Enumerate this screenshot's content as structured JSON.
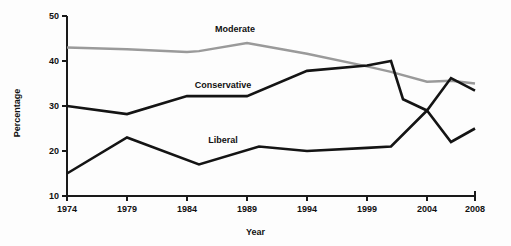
{
  "chart_data": {
    "type": "line",
    "title": "",
    "xlabel": "Year",
    "ylabel": "Percentage",
    "x": [
      1974,
      1979,
      1984,
      1989,
      1994,
      1999,
      2004,
      2008
    ],
    "xlim": [
      1974,
      2008
    ],
    "ylim": [
      10,
      50
    ],
    "xticks": [
      1974,
      1979,
      1984,
      1989,
      1994,
      1999,
      2004,
      2008
    ],
    "yticks": [
      10,
      20,
      30,
      40,
      50
    ],
    "grid": false,
    "legend": "inline-labels",
    "series": [
      {
        "name": "Moderate",
        "color": "#9a9a9a",
        "label_year": 1988,
        "label_value": 47.2,
        "points": [
          {
            "year": 1974,
            "value": 43.0
          },
          {
            "year": 1979,
            "value": 42.6
          },
          {
            "year": 1984,
            "value": 42.0
          },
          {
            "year": 1985,
            "value": 42.2
          },
          {
            "year": 1989,
            "value": 44.0
          },
          {
            "year": 1994,
            "value": 41.6
          },
          {
            "year": 1999,
            "value": 38.8
          },
          {
            "year": 2001,
            "value": 37.6
          },
          {
            "year": 2004,
            "value": 35.4
          },
          {
            "year": 2006,
            "value": 35.6
          },
          {
            "year": 2008,
            "value": 35.0
          }
        ]
      },
      {
        "name": "Conservative",
        "color": "#141414",
        "label_year": 1987,
        "label_value": 34.6,
        "points": [
          {
            "year": 1974,
            "value": 30.0
          },
          {
            "year": 1979,
            "value": 28.2
          },
          {
            "year": 1984,
            "value": 32.2
          },
          {
            "year": 1989,
            "value": 32.2
          },
          {
            "year": 1994,
            "value": 37.8
          },
          {
            "year": 1999,
            "value": 39.0
          },
          {
            "year": 2001,
            "value": 40.0
          },
          {
            "year": 2002,
            "value": 31.5
          },
          {
            "year": 2004,
            "value": 29.0
          },
          {
            "year": 2006,
            "value": 36.2
          },
          {
            "year": 2008,
            "value": 33.4
          }
        ]
      },
      {
        "name": "Liberal",
        "color": "#141414",
        "label_year": 1987,
        "label_value": 22.4,
        "points": [
          {
            "year": 1974,
            "value": 15.0
          },
          {
            "year": 1979,
            "value": 23.0
          },
          {
            "year": 1985,
            "value": 17.0
          },
          {
            "year": 1990,
            "value": 21.0
          },
          {
            "year": 1994,
            "value": 20.0
          },
          {
            "year": 1999,
            "value": 20.7
          },
          {
            "year": 2001,
            "value": 21.0
          },
          {
            "year": 2004,
            "value": 29.0
          },
          {
            "year": 2006,
            "value": 22.0
          },
          {
            "year": 2008,
            "value": 25.0
          }
        ]
      }
    ]
  },
  "axis": {
    "ylabel": "Percentage",
    "xlabel": "Year"
  }
}
